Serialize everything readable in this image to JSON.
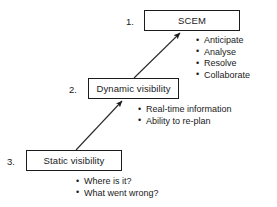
{
  "diagram": {
    "title": "",
    "background_color": "#ffffff",
    "stroke_color": "#1c1c1c",
    "text_color": "#1a1a1a",
    "levels": [
      {
        "number": "1.",
        "box_label": "SCEM",
        "bullets": [
          "Anticipate",
          "Analyse",
          "Resolve",
          "Collaborate"
        ]
      },
      {
        "number": "2.",
        "box_label": "Dynamic visibility",
        "bullets": [
          "Real-time information",
          "Ability to re-plan"
        ]
      },
      {
        "number": "3.",
        "box_label": "Static visibility",
        "bullets": [
          "Where is it?",
          "What went wrong?"
        ]
      }
    ],
    "arrows": [
      {
        "name": "static-to-dynamic",
        "from": "Static visibility",
        "to": "Dynamic visibility",
        "direction": "up-right"
      },
      {
        "name": "dynamic-to-scem",
        "from": "Dynamic visibility",
        "to": "SCEM",
        "direction": "up-right"
      }
    ]
  }
}
